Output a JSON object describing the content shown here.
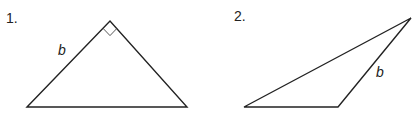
{
  "figures": [
    {
      "number": "1.",
      "side_label": "b",
      "shape": "right triangle",
      "vertices": [
        [
          27,
          107
        ],
        [
          110,
          21
        ],
        [
          187,
          107
        ]
      ],
      "right_angle_at": [
        110,
        21
      ]
    },
    {
      "number": "2.",
      "side_label": "b",
      "shape": "obtuse triangle",
      "vertices": [
        [
          244,
          107
        ],
        [
          411,
          18
        ],
        [
          338,
          107
        ]
      ]
    }
  ],
  "colors": {
    "stroke": "#222222",
    "text": "#222222",
    "background": "#ffffff"
  }
}
